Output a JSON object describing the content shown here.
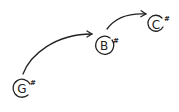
{
  "diagram": {
    "type": "note-progression",
    "notes": [
      {
        "letter": "G",
        "accidental": "#",
        "cx": 22,
        "cy": 88,
        "r": 9
      },
      {
        "letter": "B",
        "accidental": "#",
        "cx": 104,
        "cy": 45,
        "r": 9
      },
      {
        "letter": "C",
        "accidental": "#",
        "cx": 156,
        "cy": 24,
        "r": 8
      }
    ],
    "arrows": [
      {
        "from": "G#",
        "to": "B#"
      },
      {
        "from": "B#",
        "to": "C#"
      }
    ],
    "colors": {
      "ink": "#222222",
      "background": "#ffffff"
    }
  }
}
